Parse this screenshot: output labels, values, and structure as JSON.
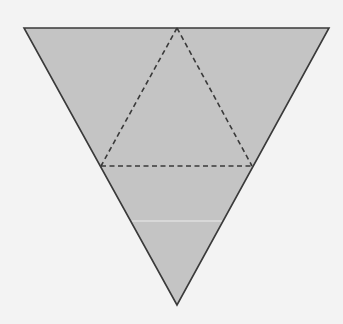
{
  "figure": {
    "colors": {
      "background": "#f3f3f3",
      "fill": "#c4c4c4",
      "outline": "#3a3a3a",
      "dashed": "#3a3a3a",
      "scan_line": "#ececec"
    },
    "outer_triangle": {
      "points": [
        [
          24,
          28
        ],
        [
          329,
          28
        ],
        [
          177,
          305
        ]
      ]
    },
    "inner_triangle_dashed": {
      "points": [
        [
          177,
          28
        ],
        [
          101,
          166
        ],
        [
          252,
          166
        ]
      ]
    },
    "scan_line": {
      "y": 221
    }
  }
}
